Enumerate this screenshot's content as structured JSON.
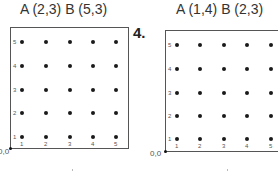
{
  "problems": [
    {
      "id": "left",
      "title": "A (2,3)  B (5,3)",
      "origin_label": "0,0",
      "x_ticks": [
        "1",
        "2",
        "3",
        "4",
        "5"
      ],
      "y_ticks": [
        "1",
        "2",
        "3",
        "4",
        "5"
      ]
    },
    {
      "id": "right",
      "number_label": "4.",
      "title": "A (1,4)  B (2,3)",
      "origin_label": "0,0",
      "x_ticks": [
        "1",
        "2",
        "3",
        "4",
        "5"
      ],
      "y_ticks": [
        "1",
        "2",
        "3",
        "4",
        "5"
      ]
    }
  ],
  "colors": {
    "frame": "#555555",
    "dot": "#1a1a1a",
    "label": "#555555"
  }
}
